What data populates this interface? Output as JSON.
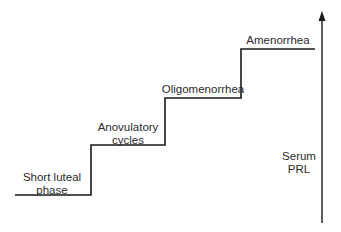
{
  "diagram": {
    "type": "staircase",
    "axis_label": [
      "Serum",
      "PRL"
    ],
    "axis_direction": "up",
    "steps": [
      {
        "level": 1,
        "label": [
          "Short luteal",
          "phase"
        ]
      },
      {
        "level": 2,
        "label": [
          "Anovulatory",
          "cycles"
        ]
      },
      {
        "level": 3,
        "label": [
          "Oligomenorrhea"
        ]
      },
      {
        "level": 4,
        "label": [
          "Amenorrhea"
        ]
      }
    ],
    "colors": {
      "line": "#1a1a1a",
      "text": "#2a2a2a",
      "background": "#ffffff"
    }
  }
}
